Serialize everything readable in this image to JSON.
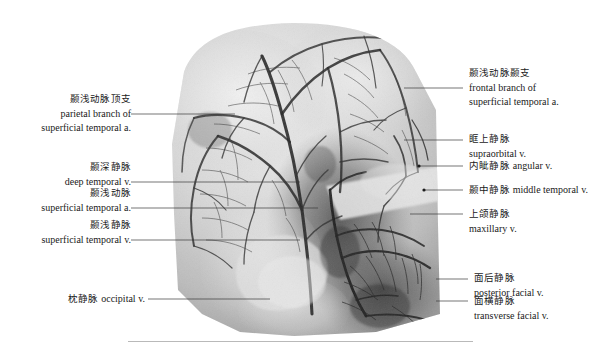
{
  "figure": {
    "image_alt_name": "vascular-specimen-radiograph"
  },
  "labels_left": [
    {
      "id": "parietal-branch-superficial-temporal-artery",
      "cn": "颞浅动脉顶支",
      "en_line1": "parietal branch of",
      "en_line2": "superficial temporal a."
    },
    {
      "id": "deep-temporal-vein",
      "cn": "颞深静脉",
      "en_line1": "deep temporal v."
    },
    {
      "id": "superficial-temporal-artery",
      "cn": "颞浅动脉",
      "en_line1": "superficial temporal a."
    },
    {
      "id": "superficial-temporal-vein",
      "cn": "颞浅静脉",
      "en_line1": "superficial temporal  v."
    },
    {
      "id": "occipital-vein",
      "cn": "枕静脉",
      "en_line1": "occipital v."
    }
  ],
  "labels_right": [
    {
      "id": "frontal-branch-superficial-temporal-artery",
      "cn": "颞浅动脉颞支",
      "en_line1": "frontal branch of",
      "en_line2": "superficial temporal a."
    },
    {
      "id": "supraorbital-vein",
      "cn": "眶上静脉",
      "en_line1": "supraorbital v."
    },
    {
      "id": "angular-vein",
      "cn": "内眦静脉",
      "en_line1": "angular v."
    },
    {
      "id": "middle-temporal-vein",
      "cn": "颞中静脉",
      "en_line1": "middle temporal v."
    },
    {
      "id": "maxillary-vein",
      "cn": "上颌静脉",
      "en_line1": "maxillary v."
    },
    {
      "id": "posterior-facial-vein",
      "cn": "面后静脉",
      "en_line1": "posterior facial v."
    },
    {
      "id": "transverse-facial-vein",
      "cn": "面横静脉",
      "en_line1": "transverse facial v."
    }
  ],
  "colors": {
    "text": "#1a1a1a",
    "leader_line": "#3a3a3a",
    "rule": "#b9b9b9",
    "background": "#ffffff"
  }
}
